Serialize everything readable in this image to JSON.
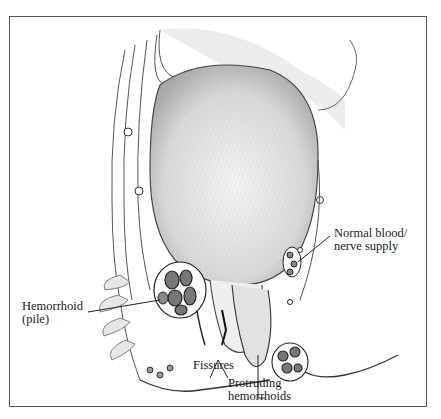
{
  "figure": {
    "labels": {
      "normal_blood": {
        "line1": "Normal blood/",
        "line2": "nerve supply"
      },
      "hemorrhoid": {
        "line1": "Hemorrhoid",
        "line2": "(pile)"
      },
      "fissures": "Fissures",
      "protruding": {
        "line1": "Protruding",
        "line2": "hemorrhoids"
      }
    },
    "colors": {
      "ink": "#2a2a2a",
      "shade": "#9a9a9a",
      "paper": "#ffffff",
      "frame": "#555555"
    }
  }
}
